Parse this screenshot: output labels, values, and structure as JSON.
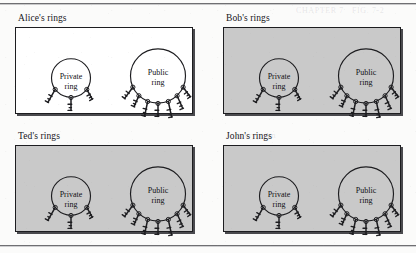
{
  "figure": {
    "panels": [
      {
        "id": "alice",
        "label": "Alice's rings",
        "shaded": false,
        "rings": [
          {
            "id": "private",
            "line1": "Private",
            "line2": "ring",
            "size": "small",
            "keys": 3
          },
          {
            "id": "public",
            "line1": "Public",
            "line2": "ring",
            "size": "large",
            "keys": 7
          }
        ]
      },
      {
        "id": "bob",
        "label": "Bob's rings",
        "shaded": true,
        "rings": [
          {
            "id": "private",
            "line1": "Private",
            "line2": "ring",
            "size": "small",
            "keys": 3
          },
          {
            "id": "public",
            "line1": "Public",
            "line2": "ring",
            "size": "large",
            "keys": 7
          }
        ]
      },
      {
        "id": "ted",
        "label": "Ted's rings",
        "shaded": true,
        "rings": [
          {
            "id": "private",
            "line1": "Private",
            "line2": "ring",
            "size": "small",
            "keys": 3
          },
          {
            "id": "public",
            "line1": "Public",
            "line2": "ring",
            "size": "large",
            "keys": 7
          }
        ]
      },
      {
        "id": "john",
        "label": "John's rings",
        "shaded": true,
        "rings": [
          {
            "id": "private",
            "line1": "Private",
            "line2": "ring",
            "size": "small",
            "keys": 3
          },
          {
            "id": "public",
            "line1": "Public",
            "line2": "ring",
            "size": "large",
            "keys": 7
          }
        ]
      }
    ],
    "colors": {
      "ink": "#1d1d20",
      "shaded_fill": "#c9c9c9",
      "plain_fill": "#ffffff",
      "page": "#fbfbfa",
      "shadow": "#4a4a4e"
    }
  }
}
